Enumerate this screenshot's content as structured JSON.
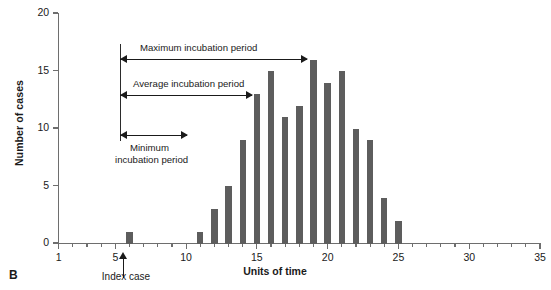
{
  "panel_letter": "B",
  "chart_data": {
    "type": "bar",
    "title": "",
    "xlabel": "Units of time",
    "ylabel": "Number of cases",
    "xlim": [
      1,
      35
    ],
    "ylim": [
      0,
      20
    ],
    "grid": false,
    "legend": "none",
    "x_tick_labels": [
      "1",
      "5",
      "10",
      "15",
      "20",
      "25",
      "30",
      "35"
    ],
    "x_tick_values": [
      1,
      5,
      10,
      15,
      20,
      25,
      30,
      35
    ],
    "y_tick_labels": [
      "0",
      "5",
      "10",
      "15",
      "20"
    ],
    "y_tick_values": [
      0,
      5,
      10,
      15,
      20
    ],
    "x": [
      6,
      11,
      12,
      13,
      14,
      15,
      16,
      17,
      18,
      19,
      20,
      21,
      22,
      23,
      24,
      25
    ],
    "values": [
      1,
      1,
      3,
      5,
      9,
      13,
      15,
      11,
      12,
      16,
      14,
      15,
      10,
      9,
      4,
      2
    ],
    "bar_color": "#5d5d5d",
    "annotations": [
      {
        "id": "maximum",
        "label": "Maximum incubation period",
        "from_x": 6,
        "to_x": 19,
        "direction": "double"
      },
      {
        "id": "average",
        "label": "Average incubation period",
        "from_x": 6,
        "to_x": 16,
        "direction": "double"
      },
      {
        "id": "minimum",
        "label": "Minimum incubation period",
        "from_x": 6,
        "to_x": 10,
        "direction": "double"
      },
      {
        "id": "index-case",
        "label": "Index case",
        "at_x": 6
      }
    ]
  },
  "annotations": {
    "maximum_label": "Maximum incubation period",
    "average_label": "Average incubation period",
    "minimum_label_line1": "Minimum",
    "minimum_label_line2": "incubation period",
    "index_case_label": "Index case"
  }
}
